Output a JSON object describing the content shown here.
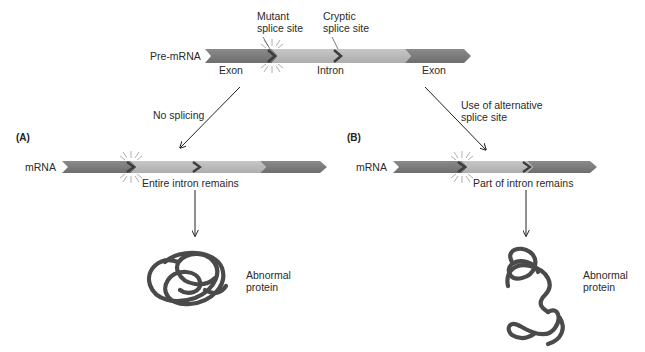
{
  "figure": {
    "pre_mrna": {
      "label": "Pre-mRNA",
      "segments": [
        "Exon",
        "Intron",
        "Exon"
      ],
      "annotations": {
        "mutant_site_line1": "Mutant",
        "mutant_site_line2": "splice site",
        "cryptic_site_line1": "Cryptic",
        "cryptic_site_line2": "splice site"
      }
    },
    "pathway_a": {
      "panel_label": "(A)",
      "arrow_label": "No splicing",
      "mrna_label": "mRNA",
      "caption": "Entire intron remains",
      "outcome_line1": "Abnormal",
      "outcome_line2": "protein"
    },
    "pathway_b": {
      "panel_label": "(B)",
      "arrow_label_line1": "Use of alternative",
      "arrow_label_line2": "splice site",
      "mrna_label": "mRNA",
      "caption": "Part of intron remains",
      "outcome_line1": "Abnormal",
      "outcome_line2": "protein"
    },
    "colors": {
      "exon": "#7a7a7a",
      "intron": "#b9b9b9",
      "chevron": "#3d3d3d",
      "protein": "#444444",
      "arrow": "#222222"
    }
  }
}
